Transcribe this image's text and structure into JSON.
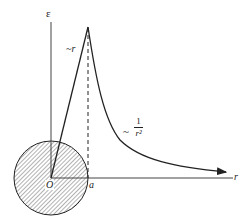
{
  "diagram": {
    "type": "electric-field-vs-radius",
    "axes": {
      "y_label": "ε",
      "x_label": "r",
      "origin_label": "O",
      "radius_label": "a"
    },
    "annotations": {
      "inside_trend": "~r",
      "outside_trend_prefix": "~",
      "outside_trend_numerator": "1",
      "outside_trend_denominator": "r²"
    },
    "sphere": {
      "fill": "hatched",
      "radius_label": "a"
    },
    "colors": {
      "stroke": "#222222",
      "hatch": "#555555"
    }
  }
}
